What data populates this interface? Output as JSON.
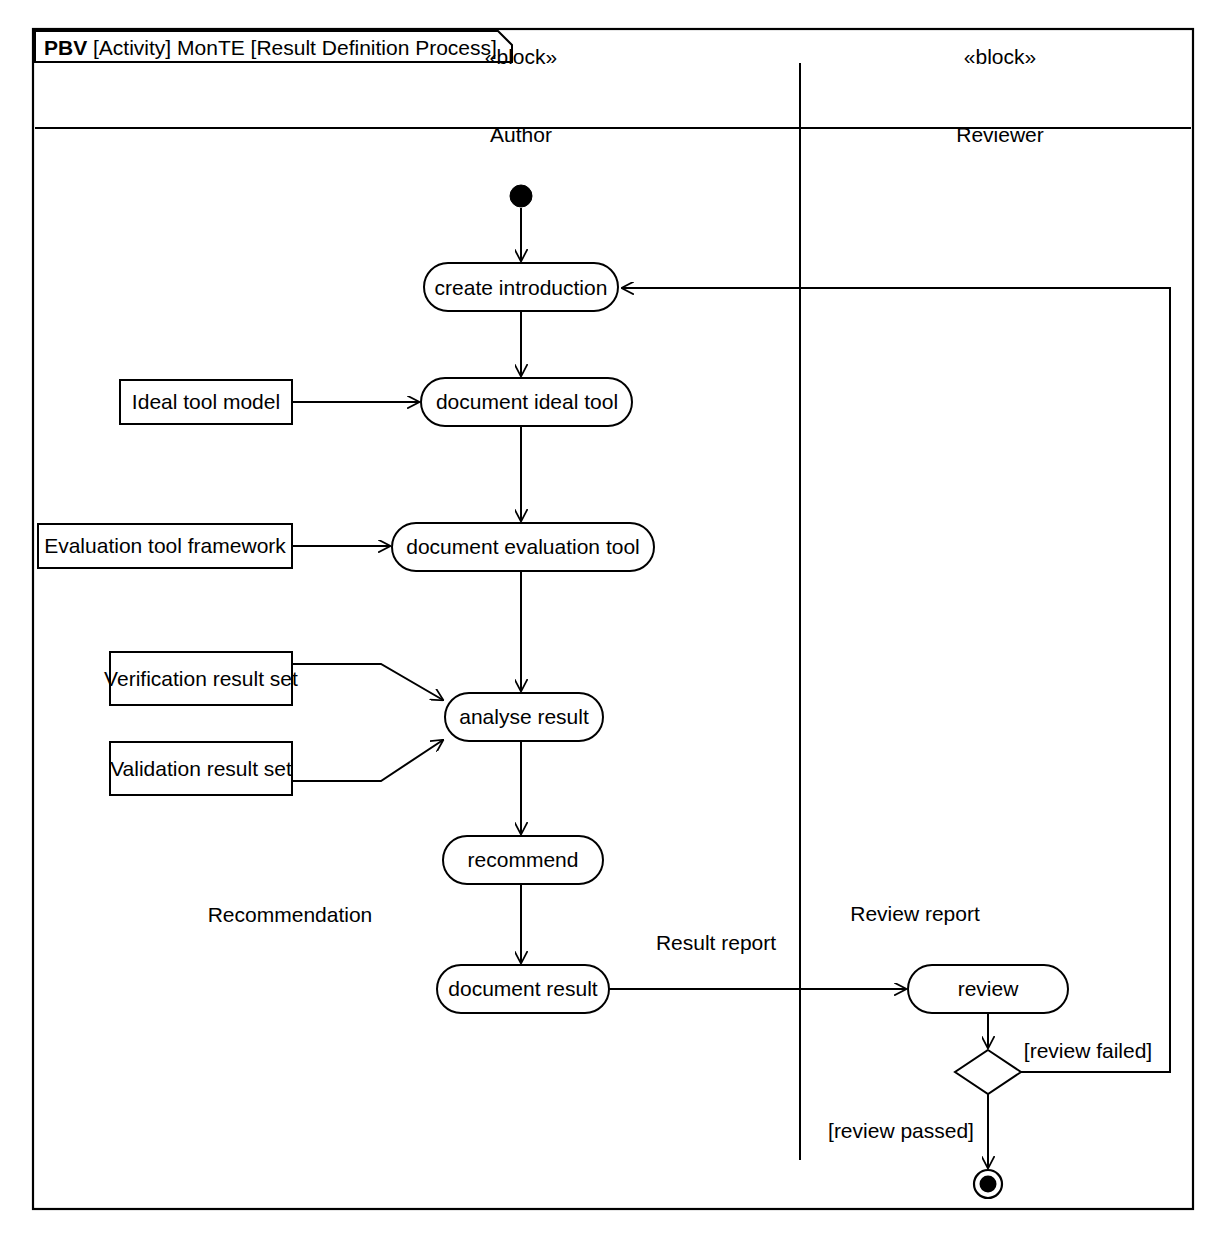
{
  "diagram": {
    "frame": {
      "keyword": "PBV",
      "type": "[Activity]",
      "model": "MonTE",
      "name": "[Result Definition Process]"
    },
    "partitions": [
      {
        "id": "author",
        "stereotype": "«block»",
        "name": "Author"
      },
      {
        "id": "reviewer",
        "stereotype": "«block»",
        "name": "Reviewer"
      }
    ],
    "nodes": [
      {
        "id": "initial",
        "kind": "initial-node",
        "label": "",
        "partition": "author"
      },
      {
        "id": "create_introduction",
        "kind": "action",
        "label": "create introduction",
        "partition": "author"
      },
      {
        "id": "ideal_tool_model",
        "kind": "object-node",
        "label": "Ideal tool model",
        "partition": "author"
      },
      {
        "id": "document_ideal_tool",
        "kind": "action",
        "label": "document ideal tool",
        "partition": "author"
      },
      {
        "id": "evaluation_tool_framework",
        "kind": "object-node",
        "label": "Evaluation tool framework",
        "partition": "author"
      },
      {
        "id": "document_evaluation_tool",
        "kind": "action",
        "label": "document evaluation tool",
        "partition": "author"
      },
      {
        "id": "verification_result_set",
        "kind": "object-node",
        "label": "Verification result set",
        "partition": "author"
      },
      {
        "id": "validation_result_set",
        "kind": "object-node",
        "label": "Validation result set",
        "partition": "author"
      },
      {
        "id": "analyse_result",
        "kind": "action",
        "label": "analyse result",
        "partition": "author"
      },
      {
        "id": "recommend",
        "kind": "action",
        "label": "recommend",
        "partition": "author"
      },
      {
        "id": "document_result",
        "kind": "action",
        "label": "document result",
        "partition": "author"
      },
      {
        "id": "review",
        "kind": "action",
        "label": "review",
        "partition": "reviewer"
      },
      {
        "id": "decision",
        "kind": "decision-node",
        "label": "",
        "partition": "reviewer"
      },
      {
        "id": "final",
        "kind": "final-node",
        "label": "",
        "partition": "reviewer"
      }
    ],
    "edges": [
      {
        "id": "e1",
        "from": "initial",
        "to": "create_introduction",
        "label": ""
      },
      {
        "id": "e2",
        "from": "create_introduction",
        "to": "document_ideal_tool",
        "label": ""
      },
      {
        "id": "e3",
        "from": "ideal_tool_model",
        "to": "document_ideal_tool",
        "label": ""
      },
      {
        "id": "e4",
        "from": "document_ideal_tool",
        "to": "document_evaluation_tool",
        "label": ""
      },
      {
        "id": "e5",
        "from": "evaluation_tool_framework",
        "to": "document_evaluation_tool",
        "label": ""
      },
      {
        "id": "e6",
        "from": "document_evaluation_tool",
        "to": "analyse_result",
        "label": ""
      },
      {
        "id": "e7",
        "from": "verification_result_set",
        "to": "analyse_result",
        "label": ""
      },
      {
        "id": "e8",
        "from": "validation_result_set",
        "to": "analyse_result",
        "label": ""
      },
      {
        "id": "e9",
        "from": "analyse_result",
        "to": "recommend",
        "label": ""
      },
      {
        "id": "e10",
        "from": "recommend",
        "to": "document_result",
        "label": "Recommendation"
      },
      {
        "id": "e11",
        "from": "document_result",
        "to": "review",
        "label": "Result report"
      },
      {
        "id": "e12",
        "from": "review",
        "to": "decision",
        "label": "Review report"
      },
      {
        "id": "e13",
        "from": "decision",
        "to": "final",
        "label": "[review passed]"
      },
      {
        "id": "e14",
        "from": "decision",
        "to": "create_introduction",
        "label": "[review failed]"
      }
    ],
    "edge_labels": {
      "recommendation": "Recommendation",
      "result_report": "Result report",
      "review_report": "Review report",
      "review_failed": "[review failed]",
      "review_passed": "[review passed]"
    },
    "style": {
      "line_color": "#000000",
      "fill_color": "#ffffff",
      "background": "#ffffff"
    }
  }
}
